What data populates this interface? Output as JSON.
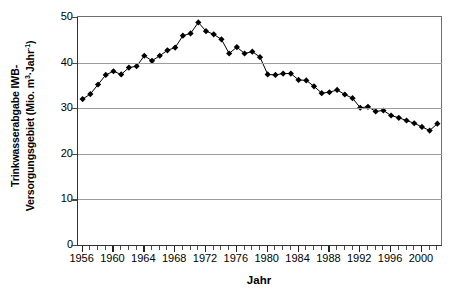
{
  "chart_data": {
    "type": "line",
    "title": "",
    "xlabel": "Jahr",
    "ylabel_line1": "Trinkwasserabgabe IWB-",
    "ylabel_line2_pre": "Versorgungsgebiet (Mio. m",
    "ylabel_sup1": "3",
    "ylabel_mid": "·Jahr",
    "ylabel_sup2": "-1",
    "ylabel_post": ")",
    "ylabel_plain": "Trinkwasserabgabe IWB-Versorgungsgebiet (Mio. m3·Jahr-1)",
    "xlim": [
      1955.4,
      2002.6
    ],
    "ylim": [
      0,
      50
    ],
    "y_ticks": [
      0,
      10,
      20,
      30,
      40,
      50
    ],
    "y_tick_labels": [
      "0",
      "10",
      "20",
      "30",
      "40",
      "50"
    ],
    "x_ticks": [
      1956,
      1960,
      1964,
      1968,
      1972,
      1976,
      1980,
      1984,
      1988,
      1992,
      1996,
      2000
    ],
    "x_tick_labels": [
      "1956",
      "1960",
      "1964",
      "1968",
      "1972",
      "1976",
      "1980",
      "1984",
      "1988",
      "1992",
      "1996",
      "2000"
    ],
    "x_minor_tick_step": 1,
    "grid": "horizontal",
    "legend": "none",
    "marker": "filled-diamond",
    "marker_color": "#000000",
    "line_color": "#000000",
    "categories": [
      1956,
      1957,
      1958,
      1959,
      1960,
      1961,
      1962,
      1963,
      1964,
      1965,
      1966,
      1967,
      1968,
      1969,
      1970,
      1971,
      1972,
      1973,
      1974,
      1975,
      1976,
      1977,
      1978,
      1979,
      1980,
      1981,
      1982,
      1983,
      1984,
      1985,
      1986,
      1987,
      1988,
      1989,
      1990,
      1991,
      1992,
      1993,
      1994,
      1995,
      1996,
      1997,
      1998,
      1999,
      2000,
      2001,
      2002
    ],
    "values": [
      32.0,
      33.1,
      35.2,
      37.3,
      38.1,
      37.4,
      38.9,
      39.2,
      41.5,
      40.4,
      41.5,
      42.7,
      43.3,
      45.9,
      46.4,
      48.8,
      46.9,
      46.2,
      45.1,
      42.0,
      43.4,
      42.0,
      42.4,
      41.2,
      37.4,
      37.3,
      37.6,
      37.6,
      36.2,
      36.1,
      34.8,
      33.3,
      33.5,
      34.0,
      33.0,
      32.2,
      30.1,
      30.3,
      29.3,
      29.5,
      28.4,
      27.9,
      27.3,
      26.7,
      25.9,
      25.1,
      26.6
    ],
    "series": [
      {
        "name": "Trinkwasserabgabe",
        "values": [
          32.0,
          33.1,
          35.2,
          37.3,
          38.1,
          37.4,
          38.9,
          39.2,
          41.5,
          40.4,
          41.5,
          42.7,
          43.3,
          45.9,
          46.4,
          48.8,
          46.9,
          46.2,
          45.1,
          42.0,
          43.4,
          42.0,
          42.4,
          41.2,
          37.4,
          37.3,
          37.6,
          37.6,
          36.2,
          36.1,
          34.8,
          33.3,
          33.5,
          34.0,
          33.0,
          32.2,
          30.1,
          30.3,
          29.3,
          29.5,
          28.4,
          27.9,
          27.3,
          26.7,
          25.9,
          25.1,
          26.6
        ]
      }
    ]
  }
}
